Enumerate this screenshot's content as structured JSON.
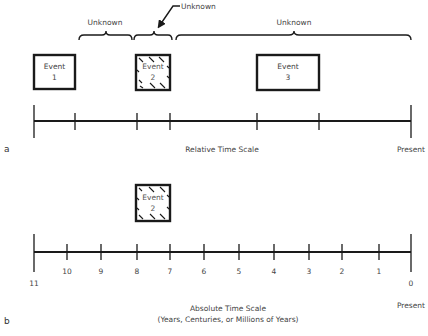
{
  "panel_a": {
    "label": "a",
    "scale_label": "Relative Time Scale",
    "end_label": "Present",
    "braces": [
      {
        "label": "Unknown"
      },
      {
        "label": "Unknown",
        "arrow": true
      },
      {
        "label": "Unknown"
      }
    ],
    "events": [
      {
        "line1": "Event",
        "line2": "1",
        "hatched": false
      },
      {
        "line1": "Event",
        "line2": "2",
        "hatched": true
      },
      {
        "line1": "Event",
        "line2": "3",
        "hatched": false
      }
    ]
  },
  "panel_b": {
    "label": "b",
    "scale_label": "Absolute Time Scale",
    "scale_sublabel": "(Years, Centuries, or Millions of Years)",
    "end_label": "Present",
    "tick_labels": [
      "11",
      "10",
      "9",
      "8",
      "7",
      "6",
      "5",
      "4",
      "3",
      "2",
      "1",
      "0"
    ],
    "event": {
      "line1": "Event",
      "line2": "2",
      "hatched": true
    }
  }
}
